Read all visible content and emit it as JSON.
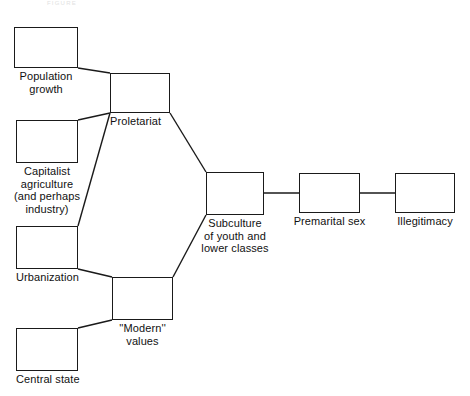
{
  "figure": {
    "background_color": "#ffffff",
    "stroke_color": "#1a1a1a",
    "text_color": "#111111",
    "header_caption": "FIGURE"
  },
  "chart_data": {
    "type": "diagram",
    "title": "",
    "subtitle": "",
    "legend": [],
    "grid": false,
    "nodes": [
      {
        "id": "population-growth",
        "label": "Population\ngrowth",
        "x": 14,
        "y": 27,
        "w": 64,
        "h": 41,
        "label_align": "center"
      },
      {
        "id": "capitalist-agriculture",
        "label": "Capitalist\nagriculture\n(and perhaps\nindustry)",
        "x": 16,
        "y": 120,
        "w": 62,
        "h": 43,
        "label_align": "center"
      },
      {
        "id": "urbanization",
        "label": "Urbanization",
        "x": 16,
        "y": 226,
        "w": 62,
        "h": 43,
        "label_align": "left"
      },
      {
        "id": "central-state",
        "label": "Central state",
        "x": 16,
        "y": 328,
        "w": 62,
        "h": 43,
        "label_align": "left"
      },
      {
        "id": "proletariat",
        "label": "Proletariat",
        "x": 110,
        "y": 73,
        "w": 60,
        "h": 40,
        "label_align": "left"
      },
      {
        "id": "modern-values",
        "label": "''Modern''\nvalues",
        "x": 112,
        "y": 277,
        "w": 61,
        "h": 43,
        "label_align": "center"
      },
      {
        "id": "subculture",
        "label": "Subculture\nof youth and\nlower classes",
        "x": 206,
        "y": 172,
        "w": 58,
        "h": 43,
        "label_align": "center"
      },
      {
        "id": "premarital-sex",
        "label": "Premarital sex",
        "x": 299,
        "y": 173,
        "w": 61,
        "h": 40,
        "label_align": "center"
      },
      {
        "id": "illegitimacy",
        "label": "Illegitimacy",
        "x": 395,
        "y": 173,
        "w": 60,
        "h": 40,
        "label_align": "center"
      }
    ],
    "edges": [
      {
        "from": "population-growth",
        "to": "proletariat",
        "x1": 78,
        "y1": 68,
        "x2": 110,
        "y2": 73
      },
      {
        "from": "capitalist-agriculture",
        "to": "proletariat",
        "x1": 78,
        "y1": 120,
        "x2": 110,
        "y2": 113
      },
      {
        "from": "urbanization",
        "to": "proletariat",
        "x1": 78,
        "y1": 226,
        "x2": 110,
        "y2": 113
      },
      {
        "from": "proletariat",
        "to": "subculture",
        "x1": 170,
        "y1": 113,
        "x2": 206,
        "y2": 172
      },
      {
        "from": "urbanization",
        "to": "modern-values",
        "x1": 78,
        "y1": 269,
        "x2": 112,
        "y2": 277
      },
      {
        "from": "central-state",
        "to": "modern-values",
        "x1": 78,
        "y1": 328,
        "x2": 112,
        "y2": 320
      },
      {
        "from": "modern-values",
        "to": "subculture",
        "x1": 173,
        "y1": 277,
        "x2": 206,
        "y2": 215
      },
      {
        "from": "subculture",
        "to": "premarital-sex",
        "x1": 264,
        "y1": 193,
        "x2": 299,
        "y2": 193
      },
      {
        "from": "premarital-sex",
        "to": "illegitimacy",
        "x1": 360,
        "y1": 193,
        "x2": 395,
        "y2": 193
      }
    ]
  }
}
